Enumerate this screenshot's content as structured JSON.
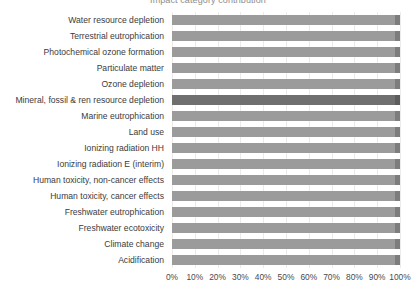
{
  "chart_data": {
    "type": "bar",
    "orientation": "horizontal",
    "title": "Impact category contribution",
    "xlabel": "",
    "ylabel": "",
    "xlim": [
      0,
      100
    ],
    "grid": true,
    "legend": "none",
    "tick_labels": [
      "0%",
      "10%",
      "20%",
      "30%",
      "40%",
      "50%",
      "60%",
      "70%",
      "80%",
      "90%",
      "100%"
    ],
    "tick_values": [
      0,
      10,
      20,
      30,
      40,
      50,
      60,
      70,
      80,
      90,
      100
    ],
    "categories": [
      "Water resource depletion",
      "Terrestrial eutrophication",
      "Photochemical ozone formation",
      "Particulate matter",
      "Ozone depletion",
      "Mineral, fossil & ren resource depletion",
      "Marine eutrophication",
      "Land use",
      "Ionizing radiation HH",
      "Ionizing radiation E (interim)",
      "Human toxicity, non-cancer effects",
      "Human toxicity, cancer effects",
      "Freshwater eutrophication",
      "Freshwater ecotoxicity",
      "Climate change",
      "Acidification"
    ],
    "series": [
      {
        "name": "Main contribution",
        "values": [
          98,
          98,
          98,
          98,
          98,
          98,
          98,
          98,
          98,
          98,
          98,
          98,
          98,
          98,
          98,
          98
        ]
      },
      {
        "name": "Remainder",
        "values": [
          2,
          2,
          2,
          2,
          2,
          2,
          2,
          2,
          2,
          2,
          2,
          2,
          2,
          2,
          2,
          2
        ]
      }
    ],
    "highlighted_category": "Mineral, fossil & ren resource depletion",
    "colors": {
      "bar_main": "#9b9b9b",
      "bar_tip": "#7d7d7d",
      "bar_main_highlight": "#6f6f6f",
      "bar_tip_highlight": "#5c5c5c",
      "gridline": "#eceaea",
      "label_text": "#3b3b3b",
      "tick_text": "#4a4a4a",
      "background": "#ffffff"
    }
  }
}
